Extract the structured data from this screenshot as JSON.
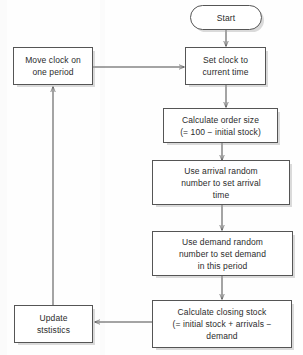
{
  "diagram": {
    "background_color": "#fefefe",
    "node_fill": "#ffffff",
    "node_border_color": "#555555",
    "shadow_color": "#a0a0a0",
    "connector_color": "#4a4a4a",
    "nodes": [
      {
        "id": "start",
        "shape": "terminator",
        "label": "Start"
      },
      {
        "id": "move-clock",
        "shape": "process",
        "label": "Move clock on\none period"
      },
      {
        "id": "set-clock",
        "shape": "process",
        "label": "Set clock to\ncurrent time"
      },
      {
        "id": "calculate-order-size",
        "shape": "process",
        "label": "Calculate order size\n(= 100 − initial stock)"
      },
      {
        "id": "arrival-random-number",
        "shape": "process",
        "label": "Use arrival random\nnumber to set arrival\ntime"
      },
      {
        "id": "demand-random-number",
        "shape": "process",
        "label": "Use demand random\nnumber to set demand\nin this period"
      },
      {
        "id": "calculate-closing-stock",
        "shape": "process",
        "label": "Calculate closing stock\n(= initial stock + arrivals −\ndemand"
      },
      {
        "id": "update-statistics",
        "shape": "process",
        "label": "Update\nststistics"
      }
    ],
    "connectors": [
      {
        "id": "start-to-set-clock",
        "from": "start",
        "to": "set-clock",
        "direction": "down"
      },
      {
        "id": "move-clock-to-set-clock",
        "from": "move-clock",
        "to": "set-clock",
        "direction": "right"
      },
      {
        "id": "set-clock-to-order-size",
        "from": "set-clock",
        "to": "calculate-order-size",
        "direction": "down"
      },
      {
        "id": "order-size-to-arrival",
        "from": "calculate-order-size",
        "to": "arrival-random-number",
        "direction": "down"
      },
      {
        "id": "arrival-to-demand",
        "from": "arrival-random-number",
        "to": "demand-random-number",
        "direction": "down"
      },
      {
        "id": "demand-to-closing-stock",
        "from": "demand-random-number",
        "to": "calculate-closing-stock",
        "direction": "down"
      },
      {
        "id": "closing-stock-to-update",
        "from": "calculate-closing-stock",
        "to": "update-statistics",
        "direction": "left"
      },
      {
        "id": "update-to-move-clock",
        "from": "update-statistics",
        "to": "move-clock",
        "direction": "up"
      }
    ]
  }
}
